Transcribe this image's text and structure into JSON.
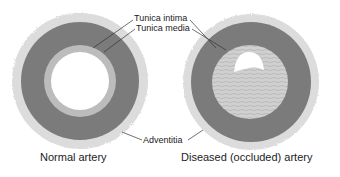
{
  "labels": {
    "tunica_intima": "Tunica intima",
    "tunica_media": "Tunica media",
    "adventitia": "Adventitia"
  },
  "captions": {
    "normal": "Normal artery",
    "diseased": "Diseased (occluded) artery"
  },
  "colors": {
    "adventitia": "#d8d8d8",
    "media": "#7a7a7a",
    "intima": "#bdbdbd",
    "plaque": "#c9c9c9",
    "lumen": "#ffffff"
  }
}
